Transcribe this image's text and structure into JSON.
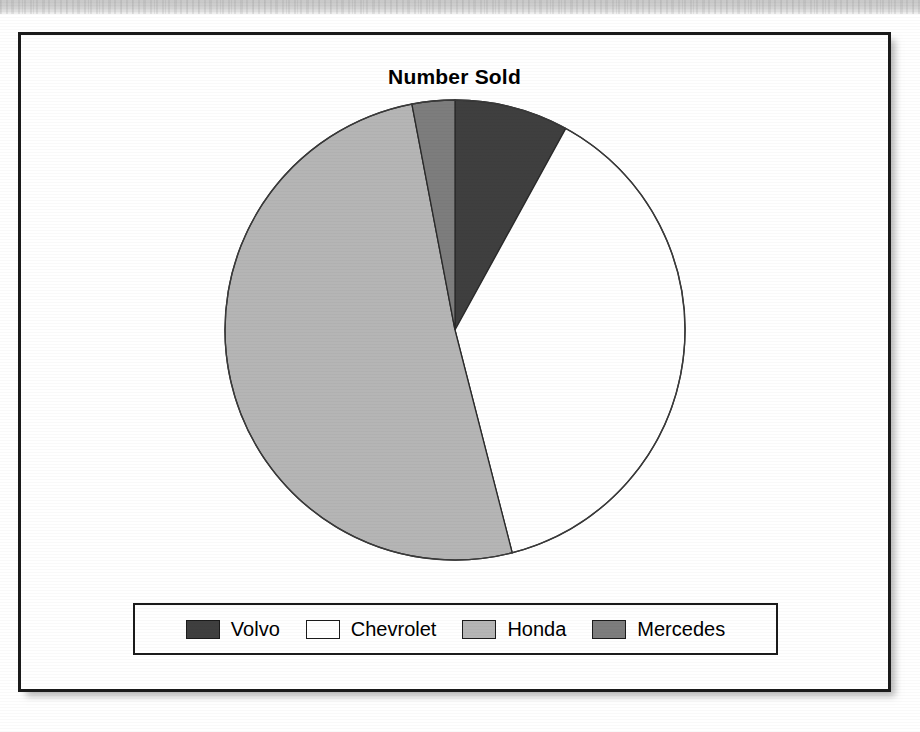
{
  "page": {
    "background_color": "#ffffff",
    "scan_band_color": "#cfcfcf"
  },
  "chart": {
    "title": "Number Sold",
    "frame_border_color": "#1b1b1b"
  },
  "legend": {
    "items": [
      {
        "label": "Volvo",
        "color": "#3f3f3f",
        "swatch_name": "legend-swatch-volvo"
      },
      {
        "label": "Chevrolet",
        "color": "#ffffff",
        "swatch_name": "legend-swatch-chevrolet"
      },
      {
        "label": "Honda",
        "color": "#b5b5b5",
        "swatch_name": "legend-swatch-honda"
      },
      {
        "label": "Mercedes",
        "color": "#7d7d7d",
        "swatch_name": "legend-swatch-mercedes"
      }
    ]
  },
  "chart_data": {
    "type": "pie",
    "title": "Number Sold",
    "xlabel": "",
    "ylabel": "",
    "start_angle_deg": 0,
    "direction": "clockwise",
    "legend_position": "bottom",
    "grid": false,
    "categories": [
      "Volvo",
      "Chevrolet",
      "Honda",
      "Mercedes"
    ],
    "values": [
      8,
      38,
      51,
      3
    ],
    "units": "percent",
    "slice_colors": [
      "#3f3f3f",
      "#ffffff",
      "#b5b5b5",
      "#7d7d7d"
    ],
    "slices": [
      {
        "label": "Volvo",
        "value": 8,
        "percent": 8,
        "color": "#3f3f3f",
        "start_deg": 0,
        "end_deg": 28.8
      },
      {
        "label": "Chevrolet",
        "value": 38,
        "percent": 38,
        "color": "#ffffff",
        "start_deg": 28.8,
        "end_deg": 165.6
      },
      {
        "label": "Honda",
        "value": 51,
        "percent": 51,
        "color": "#b5b5b5",
        "start_deg": 165.6,
        "end_deg": 349.2
      },
      {
        "label": "Mercedes",
        "value": 3,
        "percent": 3,
        "color": "#7d7d7d",
        "start_deg": 349.2,
        "end_deg": 360
      }
    ]
  }
}
